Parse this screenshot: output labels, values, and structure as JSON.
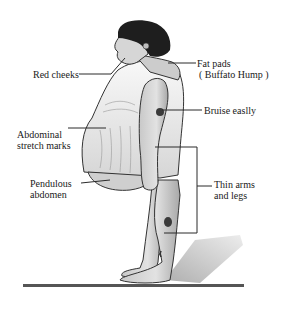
{
  "labels": {
    "red_cheeks": "Red cheeks",
    "fat_pads_line1": "Fat pads",
    "fat_pads_line2": "( Buffato  Hump )",
    "bruise": "Bruise easlly",
    "abdominal_line1": "Abdominal",
    "abdominal_line2": "stretch marks",
    "pendulous_line1": "Pendulous",
    "pendulous_line2": "abdomen",
    "thin_line1": "Thin arms",
    "thin_line2": "and legs"
  },
  "colors": {
    "line": "#2a2a2a",
    "hair": "#1e1e1e",
    "skin": "#d8d8d8",
    "skin_shadow": "#9a9a9a",
    "dress": "#f2f2f2",
    "bruise": "#3a3a3a",
    "floor": "#555555",
    "shadow": "#b8b8b8"
  }
}
